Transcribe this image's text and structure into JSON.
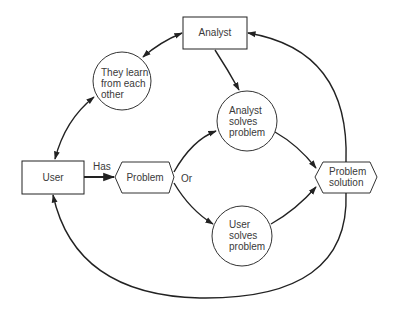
{
  "diagram": {
    "nodes": {
      "analyst": {
        "label": "Analyst",
        "shape": "rectangle"
      },
      "learn": {
        "label": "They learn from each other",
        "lines": [
          "They learn",
          "from each",
          "other"
        ],
        "shape": "circle"
      },
      "analyst_solves": {
        "label": "Analyst solves problem",
        "lines": [
          "Analyst",
          "solves",
          "problem"
        ],
        "shape": "circle"
      },
      "user": {
        "label": "User",
        "shape": "rectangle"
      },
      "problem": {
        "label": "Problem",
        "shape": "hexagon"
      },
      "user_solves": {
        "label": "User solves problem",
        "lines": [
          "User",
          "solves",
          "problem"
        ],
        "shape": "circle"
      },
      "solution": {
        "label": "Problem solution",
        "lines": [
          "Problem",
          "solution"
        ],
        "shape": "hexagon"
      }
    },
    "edge_labels": {
      "has": "Has",
      "or": "Or"
    },
    "edges": [
      {
        "from": "learn",
        "to": "analyst",
        "bidirectional": true
      },
      {
        "from": "learn",
        "to": "user",
        "bidirectional": true
      },
      {
        "from": "analyst",
        "to": "analyst_solves"
      },
      {
        "from": "user",
        "to": "problem",
        "label": "Has"
      },
      {
        "from": "problem",
        "to": "analyst_solves",
        "label": "Or"
      },
      {
        "from": "problem",
        "to": "user_solves"
      },
      {
        "from": "analyst_solves",
        "to": "solution"
      },
      {
        "from": "user_solves",
        "to": "solution"
      },
      {
        "from": "solution",
        "to": "analyst"
      },
      {
        "from": "solution",
        "to": "user"
      }
    ],
    "colors": {
      "stroke": "#222222",
      "text": "#3a3a3a",
      "background": "#ffffff"
    }
  }
}
